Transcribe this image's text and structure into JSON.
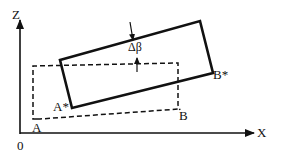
{
  "diagram": {
    "axes": {
      "z_label": "Z",
      "x_label": "X",
      "origin_label": "0"
    },
    "original_rect": {
      "style": "dashed",
      "corner_a_label": "A",
      "corner_b_label": "B"
    },
    "rotated_rect": {
      "style": "solid",
      "corner_a_label": "A*",
      "corner_b_label": "B*"
    },
    "rotation_annotation": {
      "label": "Δβ"
    },
    "colors": {
      "ink": "#111111",
      "background": "#ffffff"
    }
  }
}
